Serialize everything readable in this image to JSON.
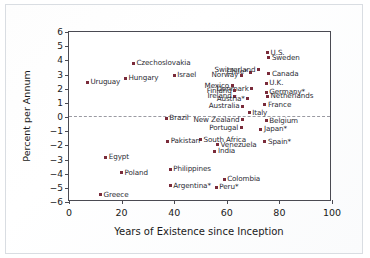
{
  "chart_data": {
    "type": "scatter",
    "title": "",
    "xlabel": "Years of Existence since Inception",
    "ylabel": "Percent per Annum",
    "xlim": [
      0,
      100
    ],
    "ylim": [
      -6,
      6
    ],
    "xticks": [
      0,
      20,
      40,
      60,
      80,
      100
    ],
    "yticks": [
      6,
      5,
      4,
      3,
      2,
      1,
      0,
      -1,
      -2,
      -3,
      -4,
      -5,
      -6
    ],
    "ytick_labels": [
      "6",
      "5",
      "4",
      "3",
      "2",
      "1",
      "0",
      "−1",
      "−2",
      "−3",
      "−4",
      "−5",
      "−6"
    ],
    "grid": false,
    "legend": null,
    "reference_line": {
      "y": 0,
      "style": "dashed"
    },
    "marker_color": "#7a2b3a",
    "points": [
      {
        "label": "Uruguay",
        "x": 7,
        "y": 2.45,
        "pos": "right"
      },
      {
        "label": "Hungary",
        "x": 21.5,
        "y": 2.75,
        "pos": "right"
      },
      {
        "label": "Czechoslovakia",
        "x": 24.5,
        "y": 3.8,
        "pos": "right"
      },
      {
        "label": "Israel",
        "x": 40,
        "y": 2.95,
        "pos": "right"
      },
      {
        "label": "Mexico",
        "x": 62,
        "y": 2.2,
        "pos": "left"
      },
      {
        "label": "Norway",
        "x": 65.5,
        "y": 2.95,
        "pos": "left"
      },
      {
        "label": "Chile*",
        "x": 69,
        "y": 3.15,
        "pos": "left"
      },
      {
        "label": "Switzerland",
        "x": 72,
        "y": 3.35,
        "pos": "left"
      },
      {
        "label": "U.S.",
        "x": 75.5,
        "y": 4.55,
        "pos": "right"
      },
      {
        "label": "Sweden",
        "x": 76,
        "y": 4.2,
        "pos": "right"
      },
      {
        "label": "Canada",
        "x": 76,
        "y": 3.05,
        "pos": "right"
      },
      {
        "label": "U.K.",
        "x": 75,
        "y": 2.4,
        "pos": "right"
      },
      {
        "label": "Denmark",
        "x": 69.5,
        "y": 2.0,
        "pos": "left"
      },
      {
        "label": "Finland",
        "x": 63,
        "y": 1.85,
        "pos": "left"
      },
      {
        "label": "Germany*",
        "x": 75,
        "y": 1.75,
        "pos": "right"
      },
      {
        "label": "Netherlands",
        "x": 75.5,
        "y": 1.45,
        "pos": "right"
      },
      {
        "label": "Ireland",
        "x": 63,
        "y": 1.45,
        "pos": "left"
      },
      {
        "label": "Austria*",
        "x": 68,
        "y": 1.3,
        "pos": "left"
      },
      {
        "label": "France",
        "x": 74.5,
        "y": 0.85,
        "pos": "right"
      },
      {
        "label": "Australia",
        "x": 66,
        "y": 0.75,
        "pos": "left"
      },
      {
        "label": "Italy",
        "x": 68.5,
        "y": 0.3,
        "pos": "right"
      },
      {
        "label": "Belgium",
        "x": 75,
        "y": -0.25,
        "pos": "right"
      },
      {
        "label": "Brazil",
        "x": 37,
        "y": -0.1,
        "pos": "right"
      },
      {
        "label": "New Zealand",
        "x": 66,
        "y": -0.2,
        "pos": "left"
      },
      {
        "label": "Portugal",
        "x": 65.5,
        "y": -0.75,
        "pos": "left"
      },
      {
        "label": "Japan*",
        "x": 73,
        "y": -0.85,
        "pos": "right"
      },
      {
        "label": "South Africa",
        "x": 50,
        "y": -1.6,
        "pos": "right"
      },
      {
        "label": "Pakistan",
        "x": 37.5,
        "y": -1.7,
        "pos": "right"
      },
      {
        "label": "Spain*",
        "x": 74.5,
        "y": -1.75,
        "pos": "right"
      },
      {
        "label": "Venezuela",
        "x": 56.5,
        "y": -1.95,
        "pos": "right"
      },
      {
        "label": "India",
        "x": 55.5,
        "y": -2.4,
        "pos": "right"
      },
      {
        "label": "Egypt",
        "x": 14,
        "y": -2.85,
        "pos": "right"
      },
      {
        "label": "Philippines",
        "x": 38.5,
        "y": -3.7,
        "pos": "right"
      },
      {
        "label": "Poland",
        "x": 20,
        "y": -3.95,
        "pos": "right"
      },
      {
        "label": "Colombia",
        "x": 59,
        "y": -4.4,
        "pos": "right"
      },
      {
        "label": "Argentina*",
        "x": 38.5,
        "y": -4.85,
        "pos": "right"
      },
      {
        "label": "Peru*",
        "x": 56,
        "y": -4.95,
        "pos": "right"
      },
      {
        "label": "Greece",
        "x": 12,
        "y": -5.5,
        "pos": "right"
      }
    ]
  }
}
